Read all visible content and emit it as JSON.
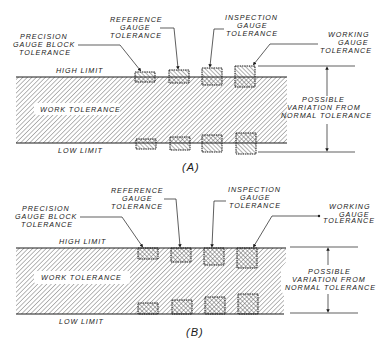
{
  "diagram_a": {
    "caption": "(A)",
    "labels": {
      "precision": [
        "PRECISION",
        "GAUGE BLOCK",
        "TOLERANCE"
      ],
      "reference": [
        "REFERENCE",
        "GAUGE",
        "TOLERANCE"
      ],
      "inspection": [
        "INSPECTION",
        "GAUGE",
        "TOLERANCE"
      ],
      "working": [
        "WORKING",
        "GAUGE",
        "TOLERANCE"
      ],
      "high_limit": "HIGH LIMIT",
      "low_limit": "LOW LIMIT",
      "work_tolerance": "WORK TOLERANCE",
      "variation": [
        "POSSIBLE",
        "VARIATION FROM",
        "NORMAL TOLERANCE"
      ]
    }
  },
  "diagram_b": {
    "caption": "(B)",
    "labels": {
      "precision": [
        "PRECISION",
        "GAUGE BLOCK",
        "TOLERANCE"
      ],
      "reference": [
        "REFERENCE",
        "GAUGE",
        "TOLERANCE"
      ],
      "inspection": [
        "INSPECTION",
        "GAUGE",
        "TOLERANCE"
      ],
      "working": [
        "WORKING",
        "GAUGE",
        "TOLERANCE"
      ],
      "high_limit": "HIGH LIMIT",
      "low_limit": "LOW LIMIT",
      "work_tolerance": "WORK TOLERANCE",
      "variation": [
        "POSSIBLE",
        "VARIATION FROM",
        "NORMAL TOLERANCE"
      ]
    }
  },
  "colors": {
    "ink": "#1a1a1a",
    "background": "#ffffff"
  }
}
